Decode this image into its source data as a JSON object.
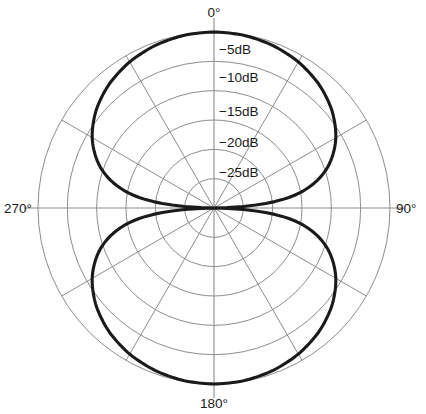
{
  "chart_data": {
    "type": "line",
    "subtype": "polar",
    "title": "",
    "angle_unit": "degrees",
    "value_unit": "dB",
    "angle_labels": [
      "0°",
      "90°",
      "180°",
      "270°"
    ],
    "angle_label_values": [
      0,
      90,
      180,
      270
    ],
    "radial_tick_labels": [
      "−5dB",
      "−10dB",
      "−15dB",
      "−20dB",
      "−25dB"
    ],
    "radial_tick_values": [
      -5,
      -10,
      -15,
      -20,
      -25
    ],
    "radial_range": [
      -30,
      0
    ],
    "outer_ring_value": 0,
    "grid": true,
    "grid_rings": 6,
    "spoke_interval_deg": 30,
    "legend": "none",
    "series": [
      {
        "name": "Figure-of-eight response",
        "color": "#1a1a1a",
        "angles": [
          0,
          10,
          20,
          30,
          40,
          50,
          60,
          70,
          80,
          85,
          90,
          95,
          100,
          110,
          120,
          130,
          140,
          150,
          160,
          170,
          180,
          190,
          200,
          210,
          220,
          230,
          240,
          250,
          260,
          265,
          270,
          275,
          280,
          290,
          300,
          310,
          320,
          330,
          340,
          350,
          360
        ],
        "values_db": [
          0.0,
          -0.13,
          -0.54,
          -1.25,
          -2.31,
          -3.84,
          -6.02,
          -9.32,
          -15.19,
          -21.17,
          -40.0,
          -21.17,
          -15.19,
          -9.32,
          -6.02,
          -3.84,
          -2.31,
          -1.25,
          -0.54,
          -0.13,
          0.0,
          -0.13,
          -0.54,
          -1.25,
          -2.31,
          -3.84,
          -6.02,
          -9.32,
          -15.19,
          -21.17,
          -40.0,
          -21.17,
          -15.19,
          -9.32,
          -6.02,
          -3.84,
          -2.31,
          -1.25,
          -0.54,
          -0.13,
          0.0
        ]
      }
    ]
  },
  "figure": {
    "center_x": 214,
    "center_y": 208,
    "outer_radius": 176,
    "grid_color": "#8d8d8d",
    "curve_color": "#1a1a1a",
    "background": "#ffffff"
  },
  "labels": {
    "top": "0°",
    "right": "90°",
    "bottom": "180°",
    "left": "270°",
    "ring5": "−5dB",
    "ring10": "−10dB",
    "ring15": "−15dB",
    "ring20": "−20dB",
    "ring25": "−25dB"
  }
}
